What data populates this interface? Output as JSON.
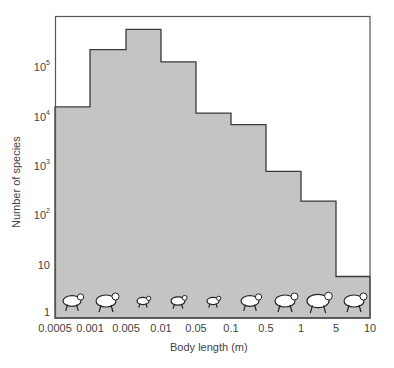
{
  "chart_data": {
    "type": "bar",
    "subtype": "histogram",
    "title": "",
    "xlabel": "Body length (m)",
    "ylabel": "Number of species",
    "x_scale": "log",
    "y_scale": "log",
    "x_bin_edges": [
      0.0005,
      0.001,
      0.005,
      0.01,
      0.05,
      0.1,
      0.5,
      1,
      5,
      10
    ],
    "x_tick_labels": [
      "0.0005",
      "0.001",
      "0.005",
      "0.01",
      "0.05",
      "0.1",
      "0.5",
      "1",
      "5",
      "10"
    ],
    "y_tick_labels": [
      "1",
      "10",
      "10^2",
      "10^3",
      "10^4",
      "10^5"
    ],
    "categories": [
      "0.0005-0.001",
      "0.001-0.005",
      "0.005-0.01",
      "0.01-0.05",
      "0.05-0.1",
      "0.1-0.5",
      "0.5-1",
      "1-5",
      "5-10"
    ],
    "values": [
      16000,
      230000,
      590000,
      130000,
      12000,
      7000,
      800,
      200,
      6
    ],
    "ylim": [
      1,
      1000000
    ],
    "grid": false,
    "legend": null,
    "annotations": [
      "mite",
      "flea",
      "ant",
      "insect",
      "shrew",
      "rat",
      "dog",
      "horse",
      "elephant"
    ],
    "fill_color": "#c4c4c2",
    "line_color": "#3a3a3a"
  },
  "axis": {
    "xlabel": "Body length (m)",
    "ylabel": "Number of species",
    "yticks": [
      {
        "base": "1",
        "exp": ""
      },
      {
        "base": "10",
        "exp": ""
      },
      {
        "base": "10",
        "exp": "2"
      },
      {
        "base": "10",
        "exp": "3"
      },
      {
        "base": "10",
        "exp": "4"
      },
      {
        "base": "10",
        "exp": "5"
      }
    ],
    "xticks": [
      "0.0005",
      "0.001",
      "0.005",
      "0.01",
      "0.05",
      "0.1",
      "0.5",
      "1",
      "5",
      "10"
    ]
  },
  "icons": [
    "mite-icon",
    "flea-icon",
    "ant-icon",
    "insect-icon",
    "shrew-icon",
    "rat-icon",
    "dog-icon",
    "horse-icon",
    "elephant-icon"
  ]
}
